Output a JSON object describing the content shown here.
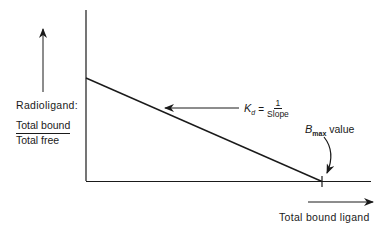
{
  "diagram": {
    "type": "scatchard-plot",
    "y_axis": {
      "title": "Radioligand:",
      "ratio_numerator": "Total bound",
      "ratio_denominator": "Total free"
    },
    "x_axis": {
      "title": "Total bound ligand"
    },
    "annotations": {
      "kd": {
        "symbol": "K",
        "subscript": "d",
        "equals": "=",
        "numerator": "1",
        "denominator": "Slope"
      },
      "bmax": {
        "symbol": "B",
        "subscript": "max",
        "suffix": " value"
      }
    },
    "line": {
      "description": "straight line with negative slope from y-intercept to x-intercept (Bmax)"
    },
    "colors": {
      "stroke": "#1a1a1a",
      "background": "#ffffff"
    }
  }
}
